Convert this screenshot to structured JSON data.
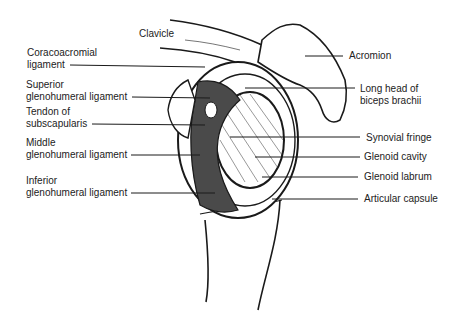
{
  "diagram": {
    "labels_left": [
      {
        "id": "clavicle",
        "text": [
          "Clavicle"
        ]
      },
      {
        "id": "coracoacromial",
        "text": [
          "Coracoacromial",
          "ligament"
        ]
      },
      {
        "id": "superior-gh",
        "text": [
          "Superior",
          "glenohumeral ligament"
        ]
      },
      {
        "id": "subscapularis",
        "text": [
          "Tendon of",
          "subscapularis"
        ]
      },
      {
        "id": "middle-gh",
        "text": [
          "Middle",
          "glenohumeral ligament"
        ]
      },
      {
        "id": "inferior-gh",
        "text": [
          "Inferior",
          "glenohumeral ligament"
        ]
      }
    ],
    "labels_right": [
      {
        "id": "acromion",
        "text": [
          "Acromion"
        ]
      },
      {
        "id": "biceps",
        "text": [
          "Long head of",
          "biceps brachii"
        ]
      },
      {
        "id": "synovial",
        "text": [
          "Synovial fringe"
        ]
      },
      {
        "id": "glenoid-cavity",
        "text": [
          "Glenoid cavity"
        ]
      },
      {
        "id": "labrum",
        "text": [
          "Glenoid labrum"
        ]
      },
      {
        "id": "capsule",
        "text": [
          "Articular capsule"
        ]
      }
    ],
    "colors": {
      "ink": "#1a1a1a",
      "ligament": "#4a4a4a",
      "paper": "#ffffff"
    }
  }
}
